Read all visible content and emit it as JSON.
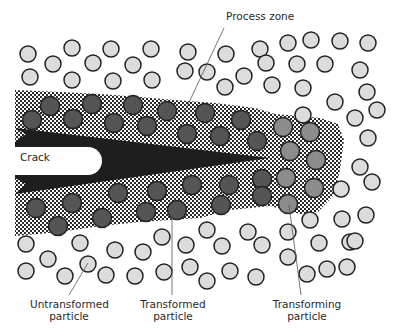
{
  "diagram": {
    "labels": {
      "process_zone": "Process zone",
      "crack": "Crack",
      "untransformed_line1": "Untransformed",
      "untransformed_line2": "particle",
      "transformed_line1": "Transformed",
      "transformed_line2": "particle",
      "transforming_line1": "Transforming",
      "transforming_line2": "particle"
    },
    "colors": {
      "untransformed_fill": "#dcdcdc",
      "transformed_fill": "#555555",
      "transforming_fill": "#8c8c8c",
      "particle_stroke": "#222222",
      "crack_fill": "#1e1e1e",
      "zone_dot": "#2a2a2a",
      "background": "#ffffff"
    },
    "particle_types": [
      "untransformed",
      "transformed",
      "transforming"
    ]
  }
}
